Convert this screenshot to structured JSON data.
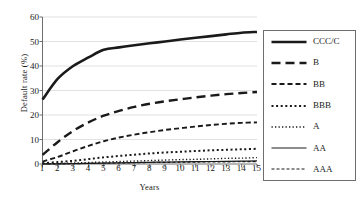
{
  "chart_data": {
    "type": "line",
    "title": "",
    "xlabel": "Years",
    "ylabel": "Default rate (%)",
    "x": [
      1,
      2,
      3,
      4,
      5,
      6,
      7,
      8,
      9,
      10,
      11,
      12,
      13,
      14,
      15
    ],
    "xlim": [
      1,
      15
    ],
    "ylim": [
      0,
      60
    ],
    "yticks": [
      0,
      10,
      20,
      30,
      40,
      50,
      60
    ],
    "xticks": [
      "1",
      "2",
      "3",
      "4",
      "5",
      "6",
      "7",
      "8",
      "9",
      "10",
      "11",
      "12",
      "13",
      "14",
      "15"
    ],
    "grid": "horizontal",
    "legend_position": "right-outside",
    "series": [
      {
        "name": "CCC/C",
        "style": "solid-thick",
        "values": [
          26.3,
          34.8,
          40.0,
          43.5,
          46.6,
          47.6,
          48.5,
          49.3,
          50.0,
          50.8,
          51.5,
          52.2,
          52.9,
          53.6,
          53.9
        ]
      },
      {
        "name": "B",
        "style": "long-dash",
        "values": [
          3.7,
          9.0,
          13.5,
          17.0,
          19.7,
          21.7,
          23.3,
          24.6,
          25.6,
          26.4,
          27.2,
          27.9,
          28.5,
          29.0,
          29.4
        ]
      },
      {
        "name": "BB",
        "style": "dash",
        "values": [
          1.0,
          2.9,
          5.2,
          7.4,
          9.3,
          10.8,
          12.0,
          13.0,
          13.9,
          14.6,
          15.3,
          15.9,
          16.4,
          16.8,
          17.0
        ]
      },
      {
        "name": "BBB",
        "style": "dot-medium",
        "values": [
          0.3,
          0.8,
          1.3,
          2.0,
          2.7,
          3.3,
          3.8,
          4.3,
          4.7,
          5.0,
          5.3,
          5.6,
          5.8,
          6.0,
          6.2
        ]
      },
      {
        "name": "A",
        "style": "dot-fine",
        "values": [
          0.1,
          0.2,
          0.4,
          0.6,
          0.8,
          1.0,
          1.2,
          1.4,
          1.6,
          1.8,
          1.9,
          2.1,
          2.3,
          2.4,
          2.6
        ]
      },
      {
        "name": "AA",
        "style": "solid-thin",
        "values": [
          0.02,
          0.07,
          0.14,
          0.24,
          0.35,
          0.47,
          0.58,
          0.69,
          0.78,
          0.87,
          0.95,
          1.03,
          1.1,
          1.17,
          1.24
        ]
      },
      {
        "name": "AAA",
        "style": "short-dash",
        "values": [
          0.0,
          0.03,
          0.13,
          0.24,
          0.35,
          0.46,
          0.52,
          0.62,
          0.68,
          0.74,
          0.79,
          0.84,
          0.89,
          0.94,
          0.99
        ]
      }
    ]
  },
  "colors": {
    "line": "#1a1a1a",
    "grid": "#d9d9d9",
    "axis": "#6e6e6e",
    "background": "#ffffff"
  }
}
